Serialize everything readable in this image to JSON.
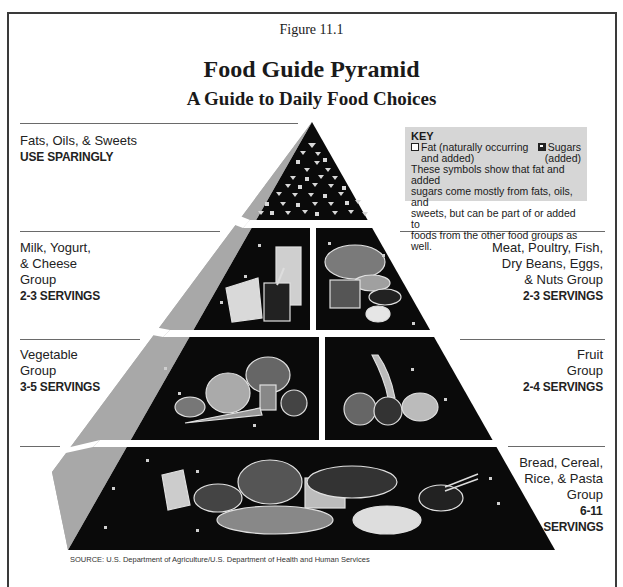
{
  "figure": {
    "label": "Figure 11.1",
    "title": "Food Guide Pyramid",
    "subtitle": "A Guide to Daily Food Choices"
  },
  "key": {
    "title": "KEY",
    "fat_symbol": "open-square",
    "fat_label_line1": "Fat (naturally occurring",
    "fat_label_line2": "and added)",
    "sugar_symbol": "inverted-triangle-in-square",
    "sugar_label_line1": "Sugars",
    "sugar_label_line2": "(added)",
    "description_lines": [
      "These symbols show that fat and added",
      "sugars come mostly from fats, oils, and",
      "sweets, but can be part of or added to",
      "foods from the other food groups as well."
    ]
  },
  "groups": [
    {
      "id": "fats",
      "name_lines": [
        "Fats, Oils, & Sweets"
      ],
      "servings": "USE SPARINGLY",
      "side": "left",
      "illustration": "fat-sugar-symbols"
    },
    {
      "id": "milk",
      "name_lines": [
        "Milk, Yogurt,",
        "& Cheese",
        "Group"
      ],
      "servings": "2-3 SERVINGS",
      "side": "left",
      "illustration": "cheese-milk-yogurt"
    },
    {
      "id": "meat",
      "name_lines": [
        "Meat, Poultry, Fish,",
        "Dry Beans, Eggs,",
        "& Nuts Group"
      ],
      "servings": "2-3 SERVINGS",
      "side": "right",
      "illustration": "chicken-fish-steak-beans-egg"
    },
    {
      "id": "vegetable",
      "name_lines": [
        "Vegetable",
        "Group"
      ],
      "servings": "3-5 SERVINGS",
      "side": "left",
      "illustration": "potato-lettuce-broccoli-carrot-tomato"
    },
    {
      "id": "fruit",
      "name_lines": [
        "Fruit",
        "Group"
      ],
      "servings": "2-4 SERVINGS",
      "side": "right",
      "illustration": "banana-orange-apple-grapes"
    },
    {
      "id": "bread",
      "name_lines": [
        "Bread, Cereal,",
        "Rice, & Pasta",
        "Group"
      ],
      "servings_lines": [
        "6-11",
        "SERVINGS"
      ],
      "side": "right",
      "illustration": "crackers-cereal-bread-pasta-rice"
    }
  ],
  "source": "SOURCE: U.S. Department of Agriculture/U.S. Department of Health and Human Services",
  "colors": {
    "pyramid_fill": "#0a0a0a",
    "side_face": "#a8a8a8",
    "separator": "#ffffff",
    "key_bg": "#d6d6d6",
    "frame": "#3a3a3a"
  }
}
